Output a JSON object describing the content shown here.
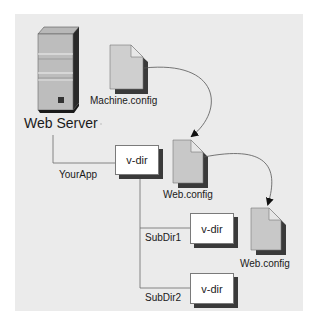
{
  "diagram": {
    "nodes": {
      "web_server": {
        "label": "Web Server",
        "icon": "server-icon"
      },
      "machine_config": {
        "label": "Machine.config",
        "icon": "document-icon"
      },
      "app_vdir": {
        "label": "v-dir",
        "caption": "YourApp"
      },
      "app_web_config": {
        "label": "Web.config",
        "icon": "document-icon"
      },
      "subdir1_vdir": {
        "label": "v-dir",
        "caption": "SubDir1"
      },
      "subdir1_web_config": {
        "label": "Web.config",
        "icon": "document-icon"
      },
      "subdir2_vdir": {
        "label": "v-dir",
        "caption": "SubDir2"
      }
    },
    "edges": [
      {
        "from": "machine_config",
        "to": "app_web_config",
        "type": "curved-arrow"
      },
      {
        "from": "app_web_config",
        "to": "subdir1_web_config",
        "type": "curved-arrow"
      },
      {
        "from": "web_server",
        "to": "app_vdir",
        "type": "tree-line"
      },
      {
        "from": "app_vdir",
        "to": "subdir1_vdir",
        "type": "tree-line"
      },
      {
        "from": "app_vdir",
        "to": "subdir2_vdir",
        "type": "tree-line"
      }
    ],
    "colors": {
      "panel_bg": "#ebebeb",
      "doc_fill": "#c8c8c8",
      "doc_shadow": "#3a3a3a",
      "line": "#6a6a6a"
    }
  }
}
